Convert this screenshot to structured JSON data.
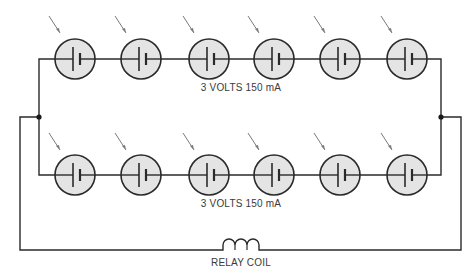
{
  "diagram": {
    "type": "circuit-schematic",
    "top_string": {
      "label": "3 VOLTS 150 mA",
      "cells": 6,
      "cell_x": [
        75,
        141,
        209,
        274,
        340,
        407
      ],
      "wire_y": 59
    },
    "bottom_string": {
      "label": "3 VOLTS 150 mA",
      "cells": 6,
      "cell_x": [
        75,
        141,
        209,
        274,
        340,
        407
      ],
      "wire_y": 175
    },
    "load": {
      "label": "RELAY COIL",
      "loops": 3
    },
    "colors": {
      "line": "#2a2a2a",
      "cell_fill": "#e4e4e4",
      "arrow": "#7a7a7a",
      "text": "#3a3a3a"
    }
  }
}
